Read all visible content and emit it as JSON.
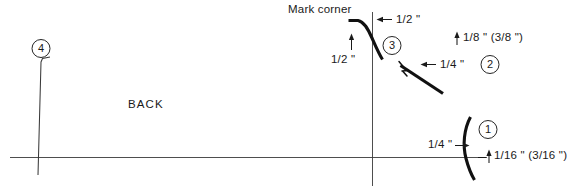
{
  "diagram": {
    "title_text": "Mark corner",
    "region_label": "BACK",
    "dimensions": {
      "top_offset": "1/2 \"",
      "left_offset": "1/2 \"",
      "vertical_rise": "1/8 \" (3/8 \")",
      "mid_offset": "1/4 \"",
      "low_offset": "1/4 \"",
      "low_rise": "1/16 \" (3/16 \")"
    },
    "callouts": [
      {
        "id": "1",
        "label": "1"
      },
      {
        "id": "2",
        "label": "2"
      },
      {
        "id": "3",
        "label": "3"
      },
      {
        "id": "4",
        "label": "4"
      }
    ],
    "colors": {
      "ink": "#1a1a1a",
      "thin_line": "#3a3a3a",
      "paper": "#ffffff"
    }
  }
}
